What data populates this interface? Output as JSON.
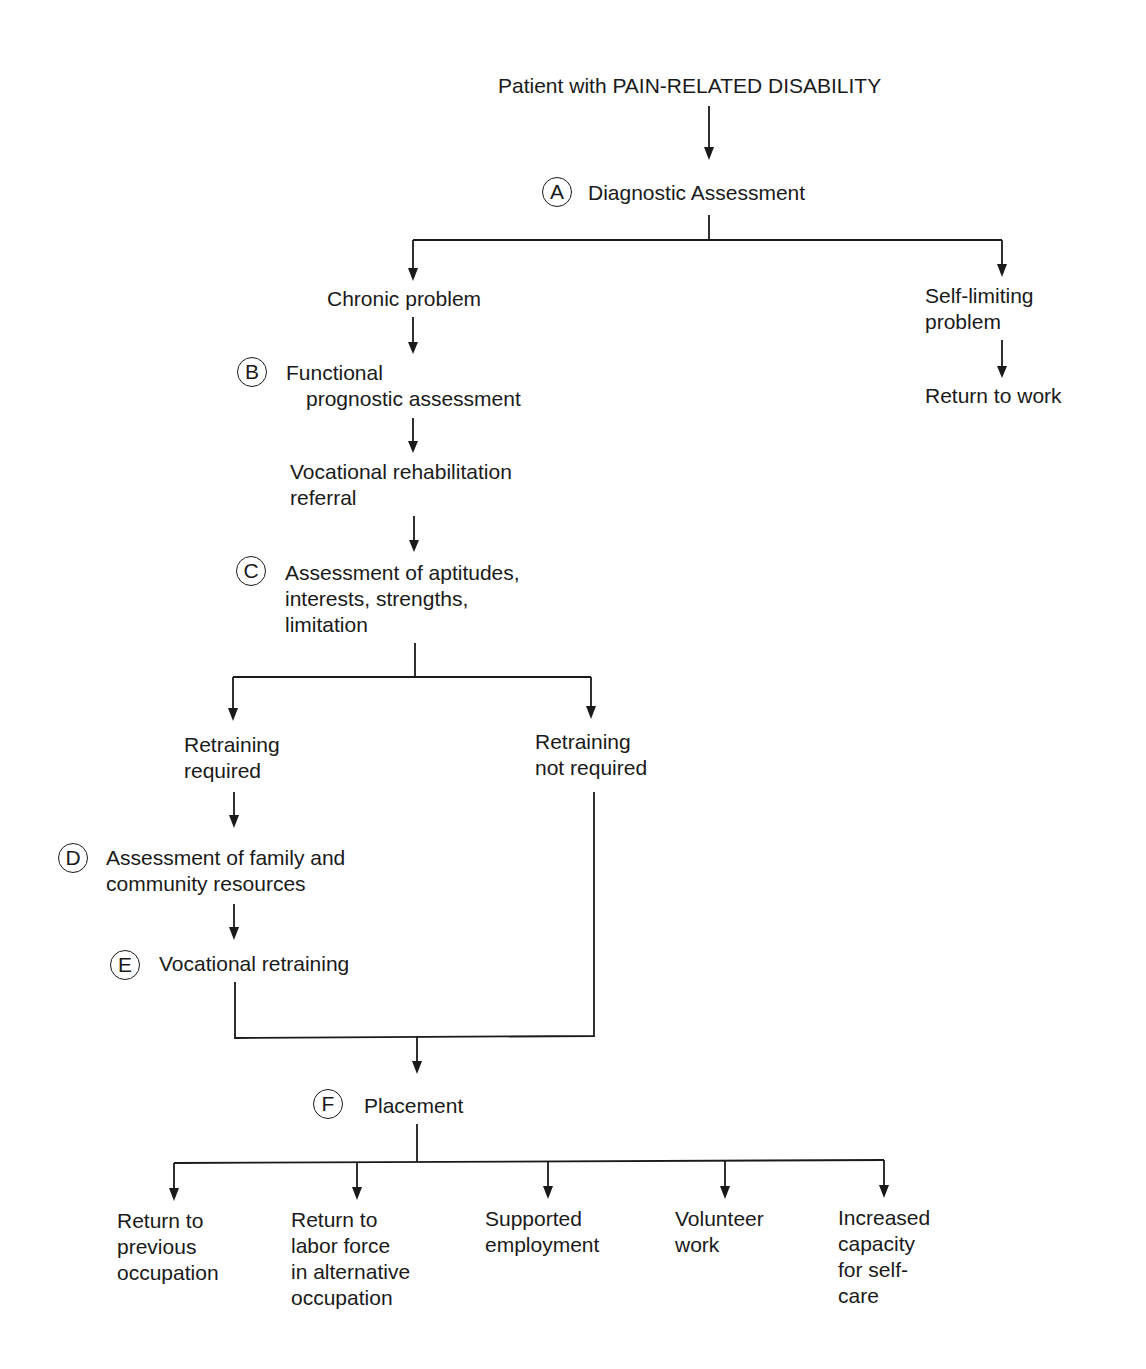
{
  "diagram": {
    "type": "flowchart",
    "nodes": {
      "start": {
        "lines": [
          "Patient with PAIN-RELATED DISABILITY"
        ]
      },
      "diagnostic": {
        "marker": "A",
        "lines": [
          "Diagnostic Assessment"
        ]
      },
      "chronic": {
        "lines": [
          "Chronic problem"
        ]
      },
      "self_limiting": {
        "lines": [
          "Self-limiting",
          "problem"
        ]
      },
      "return_to_work": {
        "lines": [
          "Return to work"
        ]
      },
      "functional": {
        "marker": "B",
        "lines": [
          "Functional",
          "prognostic assessment"
        ]
      },
      "voc_referral": {
        "lines": [
          "Vocational rehabilitation",
          "referral"
        ]
      },
      "aptitudes": {
        "marker": "C",
        "lines": [
          "Assessment of aptitudes,",
          "interests, strengths,",
          "limitation"
        ]
      },
      "retrain_req": {
        "lines": [
          "Retraining",
          "required"
        ]
      },
      "retrain_not_req": {
        "lines": [
          "Retraining",
          "not required"
        ]
      },
      "family": {
        "marker": "D",
        "lines": [
          "Assessment of family and",
          "community resources"
        ]
      },
      "voc_retraining": {
        "marker": "E",
        "lines": [
          "Vocational retraining"
        ]
      },
      "placement": {
        "marker": "F",
        "lines": [
          "Placement"
        ]
      },
      "out_prev": {
        "lines": [
          "Return to",
          "previous",
          "occupation"
        ]
      },
      "out_alt": {
        "lines": [
          "Return to",
          "labor force",
          "in alternative",
          "occupation"
        ]
      },
      "out_supported": {
        "lines": [
          "Supported",
          "employment"
        ]
      },
      "out_volunteer": {
        "lines": [
          "Volunteer",
          "work"
        ]
      },
      "out_selfcare": {
        "lines": [
          "Increased",
          "capacity",
          "for self-",
          "care"
        ]
      }
    },
    "edges": [
      [
        "start",
        "diagnostic"
      ],
      [
        "diagnostic",
        "chronic"
      ],
      [
        "diagnostic",
        "self_limiting"
      ],
      [
        "self_limiting",
        "return_to_work"
      ],
      [
        "chronic",
        "functional"
      ],
      [
        "functional",
        "voc_referral"
      ],
      [
        "voc_referral",
        "aptitudes"
      ],
      [
        "aptitudes",
        "retrain_req"
      ],
      [
        "aptitudes",
        "retrain_not_req"
      ],
      [
        "retrain_req",
        "family"
      ],
      [
        "family",
        "voc_retraining"
      ],
      [
        "voc_retraining",
        "placement"
      ],
      [
        "retrain_not_req",
        "placement"
      ],
      [
        "placement",
        "out_prev"
      ],
      [
        "placement",
        "out_alt"
      ],
      [
        "placement",
        "out_supported"
      ],
      [
        "placement",
        "out_volunteer"
      ],
      [
        "placement",
        "out_selfcare"
      ]
    ]
  }
}
